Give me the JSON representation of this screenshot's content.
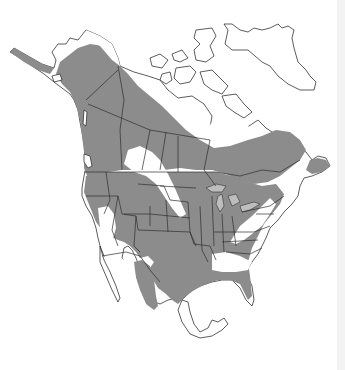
{
  "map": {
    "type": "species-range-map",
    "region": "North America",
    "colors": {
      "background": "#ffffff",
      "range_fill": "#8c8c8c",
      "outline": "#333333",
      "lakes": "#bdbdbd"
    },
    "legend": [],
    "labels": []
  }
}
